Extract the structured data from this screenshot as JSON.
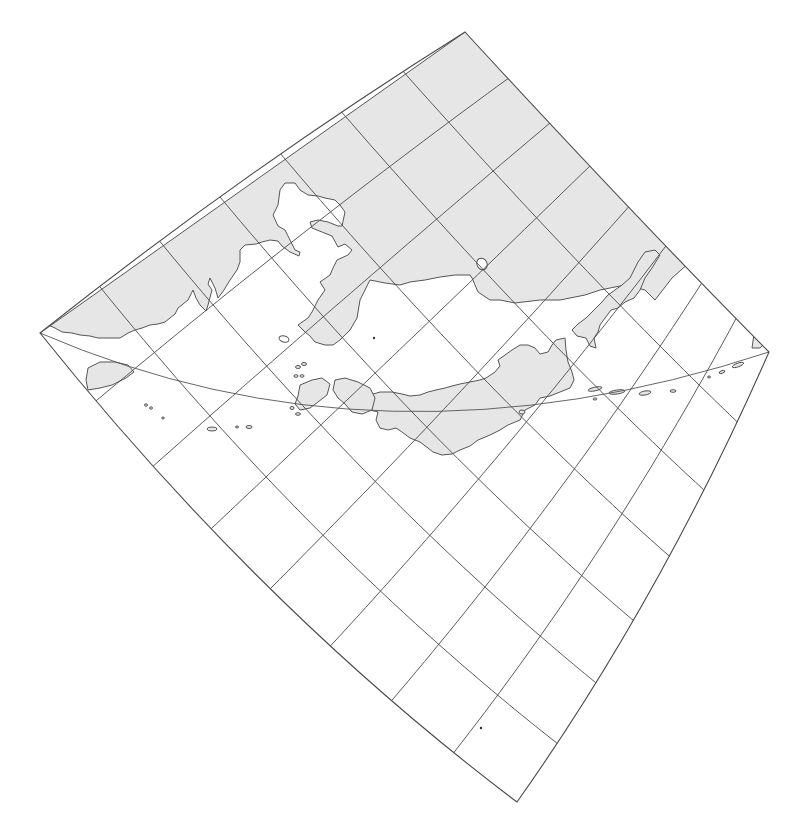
{
  "map": {
    "type": "oblique conic projection graticule",
    "background": "#ffffff",
    "land_fill": "#e6e6e6",
    "line_color": "#4a4a4a",
    "labels": [],
    "corners": {
      "top": [
        465,
        32
      ],
      "left": [
        40,
        333
      ],
      "right": [
        769,
        352
      ],
      "bottom": [
        517,
        802
      ]
    },
    "border_controls": {
      "top_left_edge": [
        248,
        168
      ],
      "top_right_edge": [
        640,
        222
      ],
      "bottom_right_edge": [
        660,
        600
      ],
      "bottom_left_edge": [
        262,
        610
      ]
    },
    "grid": {
      "meridian_count": 9,
      "parallel_count": 8,
      "note": "meridians run NW-SE from top-left edge to bottom-right edge; parallels run SW-NE from bottom-left edge to top-right edge"
    },
    "great_circle": {
      "start": [
        40,
        333
      ],
      "control": [
        380,
        480
      ],
      "end": [
        769,
        352
      ]
    },
    "regions": [
      {
        "name": "northern-landmass",
        "note": "Siberia / Russian Far East (shaded)"
      },
      {
        "name": "korean-peninsula"
      },
      {
        "name": "sakhalin"
      },
      {
        "name": "hokkaido"
      },
      {
        "name": "honshu"
      },
      {
        "name": "kyushu-shikoku"
      },
      {
        "name": "kuril-islands"
      },
      {
        "name": "taiwan-like-island"
      }
    ]
  }
}
